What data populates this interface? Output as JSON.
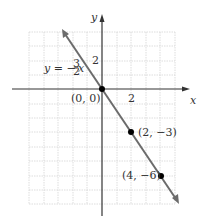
{
  "graph": {
    "equation_label": "y = −",
    "equation_frac_num": "3",
    "equation_frac_den": "2",
    "equation_var": "x",
    "x_axis_label": "x",
    "y_axis_label": "y",
    "x_tick_label": "2",
    "y_tick_label": "2",
    "origin_label": "(0, 0)",
    "points": [
      {
        "label": "(0, 0)",
        "x": 0,
        "y": 0
      },
      {
        "label": "(2, −3)",
        "x": 2,
        "y": -3
      },
      {
        "label": "(4, −6)",
        "x": 4,
        "y": -6
      }
    ],
    "colors": {
      "line": "#6b6b6b",
      "axis": "#222222",
      "grid": "#cfcfcf",
      "point": "#000000"
    }
  }
}
